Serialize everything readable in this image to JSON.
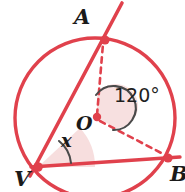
{
  "figure": {
    "type": "circle-geometry-inscribed-angle",
    "title": "",
    "colors": {
      "stroke_red": "#E0414C",
      "fill_pink": "#F6DADA",
      "arc_gray": "#4A4A4A",
      "label_dark": "#1A1A1A",
      "background": "#FFFFFF"
    },
    "circle": {
      "center_label": "O",
      "center_x": 95,
      "center_y": 118,
      "radius": 80
    },
    "points": [
      {
        "id": "A",
        "label": "A",
        "x": 105,
        "y": 40,
        "label_x": 74,
        "label_y": 6
      },
      {
        "id": "O",
        "label": "O",
        "x": 97,
        "y": 117,
        "label_x": 76,
        "label_y": 114
      },
      {
        "id": "V",
        "label": "V",
        "x": 38,
        "y": 167,
        "label_x": 14,
        "label_y": 168
      },
      {
        "id": "B",
        "label": "B",
        "x": 168,
        "y": 158,
        "label_x": 170,
        "label_y": 163
      }
    ],
    "segments": [
      {
        "id": "secant-VA",
        "from": "V",
        "to": "A",
        "style": "solid",
        "color": "#E0414C"
      },
      {
        "id": "chord-VB",
        "from": "V",
        "to": "B",
        "style": "solid",
        "color": "#E0414C"
      },
      {
        "id": "radius-OA",
        "from": "O",
        "to": "A",
        "style": "dashed",
        "color": "#E0414C"
      },
      {
        "id": "radius-OB",
        "from": "O",
        "to": "B",
        "style": "dashed",
        "color": "#E0414C"
      }
    ],
    "angles": [
      {
        "id": "central-angle",
        "vertex": "O",
        "label": "120°",
        "value": 120,
        "unit": "degrees",
        "label_x": 114,
        "label_y": 86,
        "arc_color": "#4A4A4A",
        "wedge_fill": "#F6DADA"
      },
      {
        "id": "inscribed-angle",
        "vertex": "V",
        "label": "x",
        "value": null,
        "unit": "degrees",
        "label_x": 61,
        "label_y": 132,
        "arc_color": "#4A4A4A",
        "wedge_fill": "#F6DADA"
      }
    ]
  }
}
